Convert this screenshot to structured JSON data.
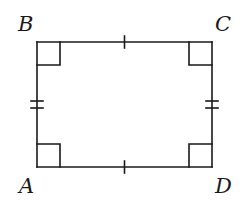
{
  "figure": {
    "type": "rectangle",
    "vertices": [
      {
        "name": "A",
        "label": "A",
        "x": 37,
        "y": 167,
        "label_x": 19,
        "label_y": 176
      },
      {
        "name": "B",
        "label": "B",
        "x": 37,
        "y": 42,
        "label_x": 18,
        "label_y": 14
      },
      {
        "name": "C",
        "label": "C",
        "x": 212,
        "y": 42,
        "label_x": 215,
        "label_y": 14
      },
      {
        "name": "D",
        "label": "D",
        "x": 212,
        "y": 167,
        "label_x": 215,
        "label_y": 176
      }
    ],
    "sides": [
      {
        "name": "AB",
        "ticks": 2
      },
      {
        "name": "BC",
        "ticks": 1
      },
      {
        "name": "CD",
        "ticks": 2
      },
      {
        "name": "DA",
        "ticks": 1
      }
    ],
    "right_angles": [
      "A",
      "B",
      "C",
      "D"
    ],
    "right_angle_size": 23,
    "stroke_color": "#1a1a1a"
  }
}
